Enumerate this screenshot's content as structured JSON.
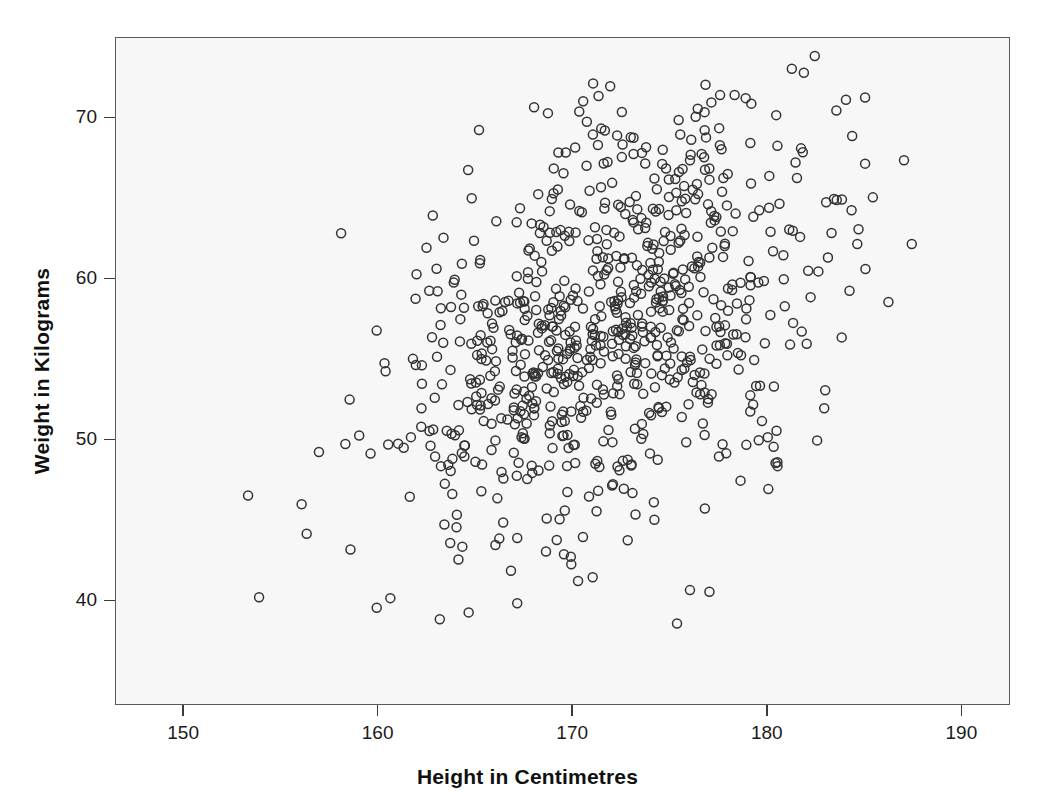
{
  "chart_data": {
    "type": "scatter",
    "title": "",
    "subtitle": "",
    "xlabel": "Height in Centimetres",
    "ylabel": "Weight in Kilograms",
    "xlim": [
      146.5,
      192.5
    ],
    "ylim": [
      33.5,
      75.0
    ],
    "xticks": [
      150,
      160,
      170,
      180,
      190
    ],
    "yticks": [
      40,
      50,
      60,
      70
    ],
    "xticklabels": [
      "150",
      "160",
      "170",
      "180",
      "190"
    ],
    "yticklabels": [
      "40",
      "50",
      "60",
      "70"
    ],
    "grid": false,
    "legend": null,
    "legend_position": "none",
    "marker": {
      "shape": "open-circle",
      "diameter_px": 9,
      "stroke_width_px": 1.5,
      "stroke_color": "#333333",
      "fill": "none"
    },
    "plot_background": "#f7f7f7",
    "frame_color": "#5a5a5a",
    "n_points": 812,
    "series": [
      {
        "name": "observations",
        "summary": {
          "x_mean": 172.0,
          "x_sd": 5.4,
          "y_mean": 57.3,
          "y_sd": 6.4,
          "correlation": 0.46
        },
        "points": [
          [
            156.3,
            44.2
          ],
          [
            159.0,
            50.3
          ],
          [
            159.9,
            39.6
          ],
          [
            160.6,
            40.2
          ],
          [
            161.0,
            49.8
          ],
          [
            160.3,
            54.8
          ],
          [
            161.6,
            46.5
          ],
          [
            162.2,
            52.0
          ],
          [
            162.6,
            59.3
          ],
          [
            163.0,
            55.2
          ],
          [
            163.4,
            47.3
          ],
          [
            163.7,
            48.1
          ],
          [
            163.2,
            48.4
          ],
          [
            164.0,
            44.6
          ],
          [
            164.3,
            43.4
          ],
          [
            164.1,
            42.6
          ],
          [
            164.6,
            66.8
          ],
          [
            164.9,
            62.4
          ],
          [
            165.2,
            61.0
          ],
          [
            165.6,
            57.9
          ],
          [
            165.0,
            53.6
          ],
          [
            165.4,
            51.2
          ],
          [
            165.8,
            49.4
          ],
          [
            166.1,
            46.4
          ],
          [
            166.4,
            44.9
          ],
          [
            166.0,
            43.5
          ],
          [
            166.8,
            41.9
          ],
          [
            167.1,
            47.8
          ],
          [
            167.5,
            50.1
          ],
          [
            167.9,
            52.3
          ],
          [
            167.3,
            54.7
          ],
          [
            167.7,
            56.2
          ],
          [
            168.1,
            58.1
          ],
          [
            168.4,
            60.5
          ],
          [
            168.8,
            62.9
          ],
          [
            168.2,
            65.3
          ],
          [
            169.0,
            66.9
          ],
          [
            169.3,
            45.1
          ],
          [
            169.7,
            46.8
          ],
          [
            170.1,
            48.6
          ],
          [
            169.5,
            50.3
          ],
          [
            169.9,
            51.8
          ],
          [
            170.3,
            53.4
          ],
          [
            170.7,
            55.0
          ],
          [
            171.0,
            56.6
          ],
          [
            170.5,
            58.2
          ],
          [
            171.4,
            59.7
          ],
          [
            171.8,
            61.3
          ],
          [
            172.1,
            62.9
          ],
          [
            171.6,
            64.4
          ],
          [
            172.0,
            66.0
          ],
          [
            172.5,
            67.6
          ],
          [
            172.8,
            43.8
          ],
          [
            173.2,
            45.4
          ],
          [
            172.6,
            47.0
          ],
          [
            173.0,
            48.5
          ],
          [
            173.5,
            50.1
          ],
          [
            173.9,
            51.7
          ],
          [
            174.2,
            53.3
          ],
          [
            173.7,
            54.8
          ],
          [
            174.0,
            56.4
          ],
          [
            174.6,
            58.0
          ],
          [
            174.9,
            59.5
          ],
          [
            174.4,
            61.1
          ],
          [
            175.0,
            62.7
          ],
          [
            175.3,
            64.3
          ],
          [
            175.7,
            65.8
          ],
          [
            176.0,
            67.4
          ],
          [
            175.5,
            69.0
          ],
          [
            176.4,
            70.6
          ],
          [
            176.8,
            72.1
          ],
          [
            177.1,
            71.0
          ],
          [
            177.5,
            69.4
          ],
          [
            176.6,
            67.8
          ],
          [
            177.0,
            66.2
          ],
          [
            177.9,
            64.6
          ],
          [
            178.2,
            63.0
          ],
          [
            177.7,
            61.4
          ],
          [
            178.6,
            59.8
          ],
          [
            178.9,
            58.2
          ],
          [
            178.4,
            56.6
          ],
          [
            179.3,
            55.0
          ],
          [
            179.6,
            53.4
          ],
          [
            179.1,
            51.8
          ],
          [
            180.0,
            50.2
          ],
          [
            180.4,
            48.6
          ],
          [
            179.8,
            59.9
          ],
          [
            180.8,
            61.5
          ],
          [
            181.1,
            63.1
          ],
          [
            180.6,
            64.7
          ],
          [
            181.5,
            66.3
          ],
          [
            181.8,
            67.9
          ],
          [
            181.3,
            57.3
          ],
          [
            182.2,
            58.9
          ],
          [
            182.6,
            60.5
          ],
          [
            182.0,
            56.0
          ],
          [
            183.0,
            64.8
          ],
          [
            183.4,
            65.0
          ],
          [
            182.9,
            52.0
          ],
          [
            183.8,
            56.4
          ],
          [
            184.2,
            59.3
          ],
          [
            184.6,
            62.2
          ],
          [
            185.0,
            71.3
          ],
          [
            185.4,
            65.1
          ],
          [
            186.2,
            58.6
          ],
          [
            187.0,
            67.4
          ],
          [
            187.4,
            62.2
          ],
          [
            180.5,
            48.4
          ],
          [
            178.6,
            47.5
          ],
          [
            176.0,
            40.7
          ],
          [
            177.0,
            40.6
          ],
          [
            171.0,
            41.5
          ],
          [
            169.9,
            42.3
          ],
          [
            168.6,
            43.1
          ],
          [
            166.2,
            43.9
          ],
          [
            162.9,
            49.0
          ],
          [
            163.5,
            50.6
          ],
          [
            164.1,
            52.2
          ],
          [
            164.7,
            53.8
          ],
          [
            165.3,
            55.4
          ],
          [
            165.9,
            57.0
          ],
          [
            166.5,
            58.6
          ],
          [
            167.1,
            60.2
          ],
          [
            167.7,
            61.8
          ],
          [
            168.3,
            63.4
          ],
          [
            168.9,
            65.0
          ],
          [
            169.5,
            66.6
          ],
          [
            170.1,
            68.2
          ],
          [
            170.7,
            69.8
          ],
          [
            171.3,
            71.4
          ],
          [
            171.9,
            72.0
          ],
          [
            172.5,
            70.4
          ],
          [
            173.1,
            68.8
          ],
          [
            173.7,
            67.2
          ],
          [
            174.3,
            65.6
          ],
          [
            174.9,
            64.0
          ],
          [
            175.5,
            62.4
          ],
          [
            176.1,
            60.8
          ],
          [
            176.7,
            59.2
          ],
          [
            177.3,
            57.6
          ],
          [
            177.9,
            56.0
          ],
          [
            178.5,
            54.4
          ],
          [
            179.1,
            52.8
          ],
          [
            179.7,
            51.2
          ],
          [
            180.3,
            49.6
          ],
          [
            170.5,
            44.0
          ],
          [
            171.2,
            45.6
          ],
          [
            172.0,
            47.2
          ],
          [
            172.8,
            48.8
          ],
          [
            173.6,
            50.4
          ],
          [
            174.4,
            52.0
          ],
          [
            175.2,
            53.6
          ],
          [
            176.0,
            55.2
          ],
          [
            176.8,
            56.8
          ],
          [
            177.6,
            58.4
          ],
          [
            166.0,
            50.0
          ],
          [
            167.0,
            51.0
          ],
          [
            168.0,
            52.0
          ],
          [
            169.0,
            53.0
          ],
          [
            170.0,
            54.0
          ],
          [
            171.0,
            55.0
          ],
          [
            172.0,
            56.0
          ],
          [
            173.0,
            57.0
          ],
          [
            174.0,
            58.0
          ],
          [
            175.0,
            59.0
          ]
        ]
      }
    ]
  },
  "axes": {
    "x": {
      "title": "Height in Centimetres",
      "ticks": [
        {
          "value": 150,
          "label": "150"
        },
        {
          "value": 160,
          "label": "160"
        },
        {
          "value": 170,
          "label": "170"
        },
        {
          "value": 180,
          "label": "180"
        },
        {
          "value": 190,
          "label": "190"
        }
      ]
    },
    "y": {
      "title": "Weight in Kilograms",
      "ticks": [
        {
          "value": 40,
          "label": "40"
        },
        {
          "value": 50,
          "label": "50"
        },
        {
          "value": 60,
          "label": "60"
        },
        {
          "value": 70,
          "label": "70"
        }
      ]
    }
  }
}
